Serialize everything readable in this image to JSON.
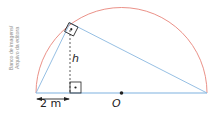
{
  "figure": {
    "credit_line1": "Banco de imagens/",
    "credit_line2": "Arquivo da editora",
    "height_label": "h",
    "center_label": "O",
    "distance_label": "2 m"
  },
  "colors": {
    "semicircle": "#e8857a",
    "triangle": "#8ab8e0",
    "diameter": "#a9cbea",
    "dashed_height": "#333333",
    "ink": "#222222"
  },
  "geometry": {
    "diameter_left": [
      36,
      93
    ],
    "diameter_right": [
      207,
      93
    ],
    "center": [
      121.5,
      93
    ],
    "apex": [
      70,
      23
    ],
    "foot_of_height": [
      70,
      93
    ],
    "right_angle_markers": [
      "apex",
      "foot_of_height"
    ]
  }
}
